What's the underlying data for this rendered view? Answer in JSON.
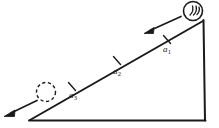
{
  "figure": {
    "background_color": "#ffffff",
    "stroke_color": "#1a1a1a",
    "width": 219,
    "height": 128
  },
  "incline": {
    "name": "right-triangle-incline",
    "apex_left": {
      "x": 30,
      "y": 120
    },
    "apex_top_right": {
      "x": 203,
      "y": 21
    },
    "corner_bottom_right": {
      "x": 205,
      "y": 120
    },
    "hypotenuse_from": {
      "x": 30,
      "y": 120
    },
    "hypotenuse_to": {
      "x": 203,
      "y": 21
    }
  },
  "bodies": [
    {
      "id": "rolling-body-top",
      "style": "solid",
      "center": {
        "x": 193,
        "y": 11
      },
      "radius": 10,
      "spin_marks": 3
    },
    {
      "id": "rolling-body-ghost",
      "style": "dashed",
      "center": {
        "x": 46,
        "y": 92
      },
      "radius": 10
    }
  ],
  "arrows": [
    {
      "id": "arrow-upper",
      "from": {
        "x": 180,
        "y": 17
      },
      "to": {
        "x": 146,
        "y": 32
      },
      "direction": "down-slope"
    },
    {
      "id": "arrow-lower",
      "from": {
        "x": 36,
        "y": 101
      },
      "to": {
        "x": 5,
        "y": 116
      },
      "direction": "down-slope"
    }
  ],
  "tick_marks": [
    {
      "id": "tick-a1",
      "x": 167,
      "y": 39
    },
    {
      "id": "tick-a2",
      "x": 117,
      "y": 60
    },
    {
      "id": "tick-a3",
      "x": 72,
      "y": 86
    }
  ],
  "labels": {
    "a1": {
      "base": "a",
      "sub": "1",
      "text": "a1"
    },
    "a2": {
      "base": "a",
      "sub": "2",
      "text": "a2"
    },
    "a3": {
      "base": "a",
      "sub": "3",
      "text": "a3"
    }
  }
}
